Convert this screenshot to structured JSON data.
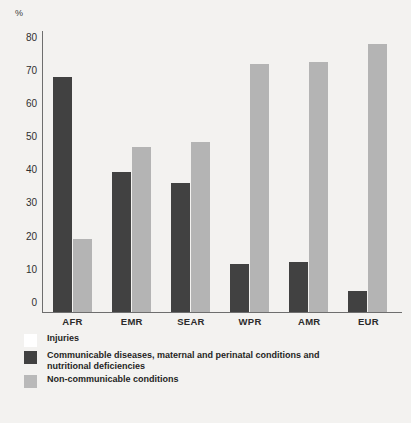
{
  "chart_data": {
    "type": "bar",
    "title": "",
    "xlabel": "",
    "ylabel": "%",
    "ylim": [
      0,
      85
    ],
    "yticks": [
      0,
      10,
      20,
      30,
      40,
      50,
      60,
      70,
      80
    ],
    "grid": false,
    "legend_position": "below",
    "categories": [
      "AFR",
      "EMR",
      "SEAR",
      "WPR",
      "AMR",
      "EUR"
    ],
    "series": [
      {
        "name": "Injuries",
        "color": "#ffffff",
        "values": [
          null,
          null,
          null,
          null,
          null,
          null
        ]
      },
      {
        "name": "Communicable diseases, maternal and perinatal conditions and nutritional deficiencies",
        "color": "#414141",
        "values": [
          71,
          42.5,
          39,
          14.5,
          15,
          6.5
        ]
      },
      {
        "name": "Non-communicable conditions",
        "color": "#b4b4b4",
        "values": [
          22,
          50,
          51.5,
          75,
          75.5,
          81
        ]
      }
    ]
  },
  "axis": {
    "y_unit": "%"
  },
  "legend": {
    "items": [
      {
        "label": "Injuries",
        "swatch": "white"
      },
      {
        "label": "Communicable diseases, maternal and perinatal conditions and",
        "label2": "nutritional deficiencies",
        "swatch": "dark"
      },
      {
        "label": "Non-communicable conditions",
        "swatch": "light"
      }
    ]
  },
  "caption": {
    "text": ""
  }
}
